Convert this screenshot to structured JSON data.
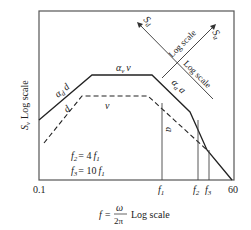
{
  "diagram": {
    "type": "tripartite-response-spectrum-sketch",
    "y_axis": {
      "symbol": "S",
      "subscript": "v",
      "label": "Log scale"
    },
    "x_axis": {
      "lhs": "f =",
      "numerator": "ω",
      "denominator": "2π",
      "label": "Log scale",
      "ticks": [
        {
          "label": "0.1",
          "position": "left-edge"
        },
        {
          "label": "f",
          "sub": "1"
        },
        {
          "label": "f",
          "sub": "2"
        },
        {
          "label": "f",
          "sub": "3"
        },
        {
          "label": "60",
          "position": "right-edge"
        }
      ]
    },
    "diagonal_axes": [
      {
        "symbol": "S",
        "subscript": "d",
        "label": "Log scale",
        "direction": "up-left"
      },
      {
        "symbol": "S",
        "subscript": "a",
        "label": "Log scale",
        "direction": "up-right"
      }
    ],
    "curves": [
      {
        "name": "elastic-design-spectrum",
        "style": "solid",
        "segments": [
          "α_d d",
          "α_v v",
          "α_a a"
        ]
      },
      {
        "name": "ground-motion-peaks",
        "style": "dashed",
        "segments": [
          "d",
          "v",
          "a"
        ]
      }
    ],
    "labels": {
      "alpha_d_d": {
        "alpha": "α",
        "sub": "d",
        "var": "d"
      },
      "alpha_v_v": {
        "alpha": "α",
        "sub": "v",
        "var": "v"
      },
      "alpha_a_a": {
        "alpha": "α",
        "sub": "a",
        "var": "a"
      },
      "d": "d",
      "v": "v",
      "a": "a"
    },
    "relations": [
      {
        "lhs": "f",
        "lhs_sub": "2",
        "rhs": "= 4",
        "rhs_var": "f",
        "rhs_sub": "1"
      },
      {
        "lhs": "f",
        "lhs_sub": "3",
        "rhs": "= 10",
        "rhs_var": "f",
        "rhs_sub": "1"
      }
    ]
  }
}
